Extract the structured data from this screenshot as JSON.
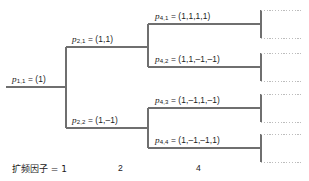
{
  "diagram": {
    "stroke_color": "#6f6f6f",
    "dotted_color": "#b9b9b9",
    "nodes": [
      {
        "id": "p11",
        "code_symbol": "p",
        "sub": "1,1",
        "eq": " = (1)",
        "label": "p1,1 = (1)",
        "level": 1
      },
      {
        "id": "p21",
        "code_symbol": "p",
        "sub": "2,1",
        "eq": " = (1,1)",
        "label": "p2,1 = (1,1)",
        "level": 2
      },
      {
        "id": "p22",
        "code_symbol": "p",
        "sub": "2,2",
        "eq": " = (1,–1)",
        "label": "p2,2 = (1,-1)",
        "level": 2
      },
      {
        "id": "p41",
        "code_symbol": "p",
        "sub": "4,1",
        "eq": " = (1,1,1,1)",
        "label": "p4,1 = (1,1,1,1)",
        "level": 4
      },
      {
        "id": "p42",
        "code_symbol": "p",
        "sub": "4,2",
        "eq": " = (1,1,–1,–1)",
        "label": "p4,2 = (1,1,-1,-1)",
        "level": 4
      },
      {
        "id": "p43",
        "code_symbol": "p",
        "sub": "4,3",
        "eq": " = (1,–1,1,–1)",
        "label": "p4,3 = (1,-1,1,-1)",
        "level": 4
      },
      {
        "id": "p44",
        "code_symbol": "p",
        "sub": "4,4",
        "eq": " = (1,–1,–1,1)",
        "label": "p4,4 = (1,-1,-1,1)",
        "level": 4
      }
    ],
    "axis": {
      "label_1": "扩频因子 = 1",
      "label_2": "2",
      "label_3": "4"
    }
  }
}
